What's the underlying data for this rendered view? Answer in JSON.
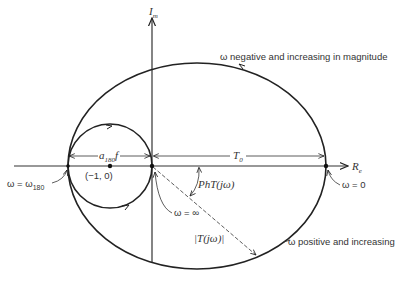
{
  "diagram": {
    "type": "nyquist-plot",
    "axes": {
      "imag_label": "I",
      "imag_sub": "m",
      "real_label": "R",
      "real_sub": "e"
    },
    "labels": {
      "negative_branch": "ω negative and increasing in magnitude",
      "positive_branch": "ω positive and increasing",
      "omega_zero": "ω = 0",
      "omega_inf": "ω = ∞",
      "omega_180": "ω = ω",
      "omega_180_sub": "180",
      "critical_point": "(−1, 0)",
      "a180f": "a",
      "a180f_sub": "180",
      "a180f_tail": "f",
      "t0": "T",
      "t0_sub": "0",
      "phase": "PhT(jω)",
      "magnitude": "|T(jω)|"
    },
    "colors": {
      "line": "#222222",
      "background": "#ffffff"
    }
  }
}
